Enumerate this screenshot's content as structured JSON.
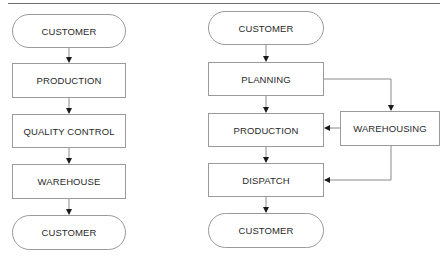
{
  "diagram": {
    "left_flow": {
      "nodes": [
        {
          "id": "l1",
          "label": "CUSTOMER",
          "shape": "terminal"
        },
        {
          "id": "l2",
          "label": "PRODUCTION",
          "shape": "process"
        },
        {
          "id": "l3",
          "label": "QUALITY CONTROL",
          "shape": "process"
        },
        {
          "id": "l4",
          "label": "WAREHOUSE",
          "shape": "process"
        },
        {
          "id": "l5",
          "label": "CUSTOMER",
          "shape": "terminal"
        }
      ],
      "edges": [
        [
          "l1",
          "l2"
        ],
        [
          "l2",
          "l3"
        ],
        [
          "l3",
          "l4"
        ],
        [
          "l4",
          "l5"
        ]
      ]
    },
    "right_flow": {
      "nodes": [
        {
          "id": "r1",
          "label": "CUSTOMER",
          "shape": "terminal"
        },
        {
          "id": "r2",
          "label": "PLANNING",
          "shape": "process"
        },
        {
          "id": "r3",
          "label": "PRODUCTION",
          "shape": "process"
        },
        {
          "id": "r4",
          "label": "DISPATCH",
          "shape": "process"
        },
        {
          "id": "r5",
          "label": "CUSTOMER",
          "shape": "terminal"
        },
        {
          "id": "r6",
          "label": "WAREHOUSING",
          "shape": "process"
        }
      ],
      "edges": [
        [
          "r1",
          "r2"
        ],
        [
          "r2",
          "r3"
        ],
        [
          "r3",
          "r4"
        ],
        [
          "r4",
          "r5"
        ],
        [
          "r2",
          "r6"
        ],
        [
          "r6",
          "r3"
        ],
        [
          "r6",
          "r4"
        ]
      ]
    },
    "colors": {
      "stroke": "#9a9a9a",
      "arrow": "#1a1a1a",
      "text": "#2a2a2a",
      "rule": "#6a6a6a"
    }
  }
}
